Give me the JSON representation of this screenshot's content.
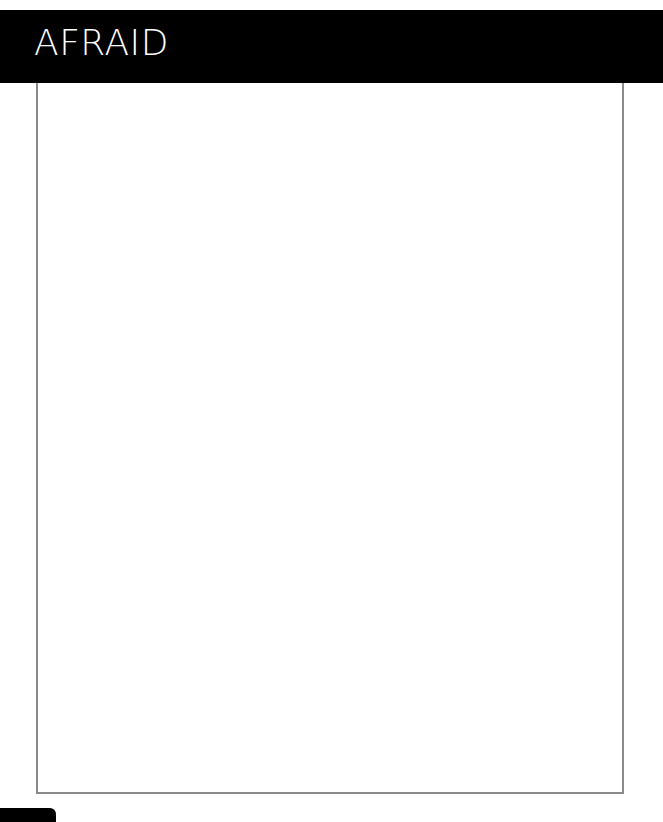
{
  "page": {
    "title": "AFRAID"
  }
}
